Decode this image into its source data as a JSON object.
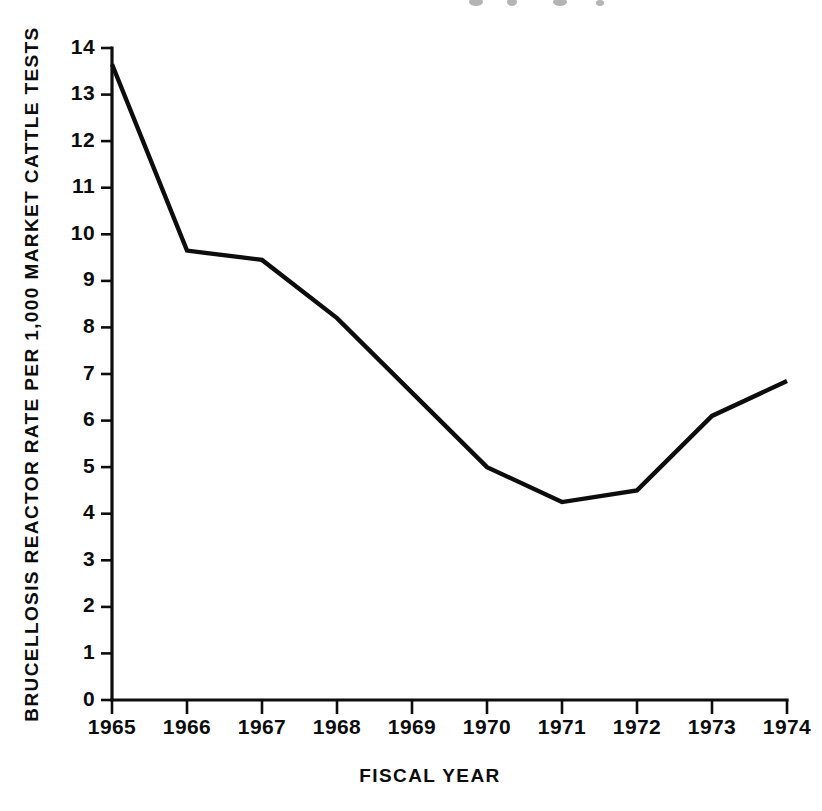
{
  "chart_data": {
    "type": "line",
    "title": "",
    "xlabel": "FISCAL YEAR",
    "ylabel": "BRUCELLOSIS REACTOR RATE PER 1,000 MARKET CATTLE TESTS",
    "categories": [
      "1965",
      "1966",
      "1967",
      "1968",
      "1969",
      "1970",
      "1971",
      "1972",
      "1973",
      "1974"
    ],
    "x": [
      1965,
      1966,
      1967,
      1968,
      1969,
      1970,
      1971,
      1972,
      1973,
      1974
    ],
    "values": [
      13.65,
      9.65,
      9.45,
      8.2,
      6.6,
      5.0,
      4.25,
      4.5,
      6.1,
      6.85
    ],
    "series": [
      {
        "name": "Brucellosis reactor rate",
        "values": [
          13.65,
          9.65,
          9.45,
          8.2,
          6.6,
          5.0,
          4.25,
          4.5,
          6.1,
          6.85
        ]
      }
    ],
    "ylim": [
      0,
      14
    ],
    "xlim": [
      1965,
      1974
    ],
    "yticks": [
      0,
      1,
      2,
      3,
      4,
      5,
      6,
      7,
      8,
      9,
      10,
      11,
      12,
      13,
      14
    ],
    "ytick_labels": [
      "0",
      "1",
      "2",
      "3",
      "4",
      "5",
      "6",
      "7",
      "8",
      "9",
      "10",
      "11",
      "12",
      "13",
      "14"
    ],
    "xtick_labels": [
      "1965",
      "1966",
      "1967",
      "1968",
      "1969",
      "1970",
      "1971",
      "1972",
      "1973",
      "1974"
    ],
    "grid": false,
    "legend": false,
    "line_color": "#0d0d0d",
    "background_color": "#ffffff"
  },
  "axis": {
    "y_title": "BRUCELLOSIS REACTOR RATE PER 1,000 MARKET CATTLE TESTS",
    "x_title": "FISCAL YEAR"
  }
}
